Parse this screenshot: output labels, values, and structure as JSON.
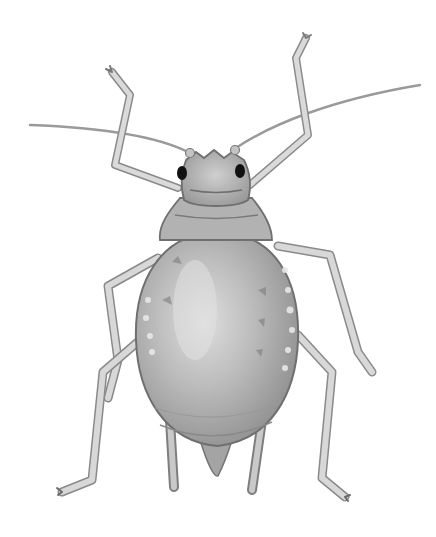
{
  "image": {
    "subject": "aphid illustration",
    "style": "grayscale pencil/watercolor drawing, dorsal view",
    "background_color": "#ffffff",
    "colors": {
      "body_fill": "#b8b8b8",
      "body_light": "#d8d8d8",
      "body_dark": "#8c8c8c",
      "outline": "#6a6a6a",
      "leg_fill": "#d4d4d4",
      "leg_outline": "#8a8a8a",
      "eye": "#111111",
      "spots": "#e6e6e6"
    },
    "parts": {
      "head": "head with crenellated front margin and two black compound eyes",
      "antennae": "two long thin antennae sweeping outward, crossing the raised front legs",
      "front_legs": "two front legs raised upward and bent at the knee",
      "mid_legs": "two middle legs bent outward and downward",
      "hind_legs": "two long hind legs extending down to claws",
      "abdomen": "large oval abdomen with pale spots along the margins",
      "cornicles": "two siphunculi (cornicles) projecting down at the rear",
      "cauda": "short pointed tail at the tip of the abdomen"
    }
  }
}
